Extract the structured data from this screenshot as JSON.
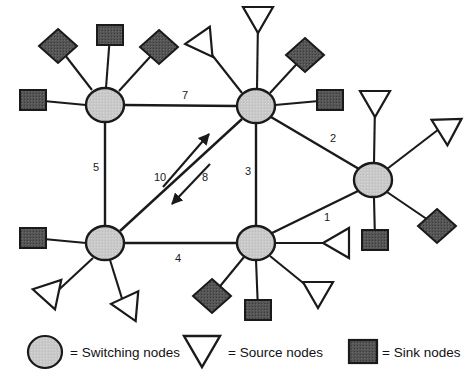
{
  "figure": {
    "type": "network-diagram",
    "background": "#ffffff",
    "stroke_color": "#1a1a1a",
    "switching_fill": "#c8c8c8",
    "sink_fill": "#4d4d4d",
    "source_fill": "#ffffff"
  },
  "switching_nodes": [
    {
      "id": "sw-top-left",
      "x": 105,
      "y": 105,
      "rx": 19,
      "ry": 17
    },
    {
      "id": "sw-top-center",
      "x": 256,
      "y": 106,
      "rx": 19,
      "ry": 17
    },
    {
      "id": "sw-right",
      "x": 373,
      "y": 180,
      "rx": 19,
      "ry": 17
    },
    {
      "id": "sw-bottom-left",
      "x": 105,
      "y": 243,
      "rx": 19,
      "ry": 17
    },
    {
      "id": "sw-bottom-center",
      "x": 256,
      "y": 243,
      "rx": 19,
      "ry": 17
    }
  ],
  "trunk_edges": [
    {
      "id": "edge-7",
      "label": "7",
      "from": "sw-top-left",
      "to": "sw-top-center",
      "x1": 124,
      "y1": 105,
      "x2": 237,
      "y2": 106,
      "lx": 185,
      "ly": 96
    },
    {
      "id": "edge-5",
      "label": "5",
      "from": "sw-top-left",
      "to": "sw-bottom-left",
      "x1": 105,
      "y1": 122,
      "x2": 105,
      "y2": 226,
      "lx": 96,
      "ly": 168
    },
    {
      "id": "edge-2",
      "label": "2",
      "from": "sw-top-center",
      "to": "sw-right",
      "x1": 271,
      "y1": 117,
      "x2": 359,
      "y2": 169,
      "lx": 333,
      "ly": 139
    },
    {
      "id": "edge-3",
      "label": "3",
      "from": "sw-top-center",
      "to": "sw-bottom-center",
      "x1": 256,
      "y1": 123,
      "x2": 256,
      "y2": 226,
      "lx": 248,
      "ly": 172
    },
    {
      "id": "edge-1",
      "label": "1",
      "from": "sw-bottom-center",
      "to": "sw-right",
      "x1": 272,
      "y1": 233,
      "x2": 358,
      "y2": 191,
      "lx": 327,
      "ly": 218
    },
    {
      "id": "edge-4",
      "label": "4",
      "from": "sw-bottom-left",
      "to": "sw-bottom-center",
      "x1": 124,
      "y1": 243,
      "x2": 237,
      "y2": 243,
      "lx": 178,
      "ly": 259
    },
    {
      "id": "edge-diagonal",
      "label": "",
      "from": "sw-bottom-left",
      "to": "sw-top-center",
      "x1": 120,
      "y1": 231,
      "x2": 242,
      "y2": 119,
      "lx": 0,
      "ly": 0
    }
  ],
  "flow_arrows": [
    {
      "id": "arrow-10",
      "label": "10",
      "x1": 163,
      "y1": 187,
      "x2": 209,
      "y2": 134,
      "lx": 160,
      "ly": 178
    },
    {
      "id": "arrow-8",
      "label": "8",
      "x1": 210,
      "y1": 164,
      "x2": 172,
      "y2": 204,
      "lx": 205,
      "ly": 178
    }
  ],
  "leaf_nodes": [
    {
      "id": "leaf-tl-diamond-nw",
      "kind": "sink",
      "shape": "diamond",
      "x": 58,
      "y": 46,
      "parent": "sw-top-left",
      "ax": 92,
      "ay": 90
    },
    {
      "id": "leaf-tl-square-n",
      "kind": "sink",
      "shape": "square",
      "x": 110,
      "y": 35,
      "parent": "sw-top-left",
      "ax": 106,
      "ay": 88
    },
    {
      "id": "leaf-tl-diamond-ne",
      "kind": "sink",
      "shape": "diamond",
      "x": 159,
      "y": 47,
      "parent": "sw-top-left",
      "ax": 119,
      "ay": 91
    },
    {
      "id": "leaf-tl-square-w",
      "kind": "sink",
      "shape": "square",
      "x": 33,
      "y": 100,
      "parent": "sw-top-left",
      "ax": 86,
      "ay": 105
    },
    {
      "id": "leaf-tc-triangle-n",
      "kind": "source",
      "shape": "triangle",
      "x": 258,
      "y": 20,
      "parent": "sw-top-center",
      "ax": 257,
      "ay": 89
    },
    {
      "id": "leaf-tc-triangle-nw",
      "kind": "source",
      "shape": "triangle",
      "x": 205,
      "y": 46,
      "parent": "sw-top-center",
      "ax": 242,
      "ay": 93
    },
    {
      "id": "leaf-tc-diamond-ne",
      "kind": "sink",
      "shape": "diamond",
      "x": 305,
      "y": 55,
      "parent": "sw-top-center",
      "ax": 270,
      "ay": 93
    },
    {
      "id": "leaf-tc-square-e",
      "kind": "sink",
      "shape": "square",
      "x": 330,
      "y": 100,
      "parent": "sw-top-center",
      "ax": 275,
      "ay": 105
    },
    {
      "id": "leaf-r-triangle-n",
      "kind": "source",
      "shape": "triangle",
      "x": 375,
      "y": 104,
      "parent": "sw-right",
      "ax": 374,
      "ay": 163
    },
    {
      "id": "leaf-r-triangle-ne",
      "kind": "source",
      "shape": "triangle",
      "x": 443,
      "y": 126,
      "parent": "sw-right",
      "ax": 387,
      "ay": 169
    },
    {
      "id": "leaf-r-diamond-se",
      "kind": "sink",
      "shape": "diamond",
      "x": 437,
      "y": 226,
      "parent": "sw-right",
      "ax": 387,
      "ay": 192
    },
    {
      "id": "leaf-r-square-s",
      "kind": "sink",
      "shape": "square",
      "x": 375,
      "y": 240,
      "parent": "sw-right",
      "ax": 374,
      "ay": 198
    },
    {
      "id": "leaf-bl-square-w",
      "kind": "sink",
      "shape": "square",
      "x": 33,
      "y": 238,
      "parent": "sw-bottom-left",
      "ax": 86,
      "ay": 243
    },
    {
      "id": "leaf-bl-triangle-sw",
      "kind": "source",
      "shape": "triangle",
      "x": 51,
      "y": 297,
      "parent": "sw-bottom-left",
      "ax": 93,
      "ay": 258
    },
    {
      "id": "leaf-bl-triangle-s",
      "kind": "source",
      "shape": "triangle",
      "x": 124,
      "y": 305,
      "parent": "sw-bottom-left",
      "ax": 110,
      "ay": 260
    },
    {
      "id": "leaf-bc-triangle-e",
      "kind": "source",
      "shape": "triangle",
      "x": 336,
      "y": 243,
      "parent": "sw-bottom-center",
      "ax": 275,
      "ay": 243
    },
    {
      "id": "leaf-bc-diamond-sw",
      "kind": "sink",
      "shape": "diamond",
      "x": 212,
      "y": 296,
      "parent": "sw-bottom-center",
      "ax": 244,
      "ay": 257
    },
    {
      "id": "leaf-bc-square-s",
      "kind": "sink",
      "shape": "square",
      "x": 258,
      "y": 310,
      "parent": "sw-bottom-center",
      "ax": 256,
      "ay": 260
    },
    {
      "id": "leaf-bc-triangle-se",
      "kind": "source",
      "shape": "triangle",
      "x": 318,
      "y": 295,
      "parent": "sw-bottom-center",
      "ax": 270,
      "ay": 256
    }
  ],
  "legend": {
    "items": [
      {
        "id": "legend-switching",
        "shape": "circle",
        "label": "= Switching nodes",
        "sx": 45,
        "sy": 352,
        "tx": 70,
        "ty": 353
      },
      {
        "id": "legend-source",
        "shape": "triangle",
        "label": "= Source nodes",
        "sx": 202,
        "sy": 351,
        "tx": 228,
        "ty": 353
      },
      {
        "id": "legend-sink",
        "shape": "square",
        "label": "= Sink nodes",
        "sx": 363,
        "sy": 352,
        "tx": 382,
        "ty": 353
      }
    ]
  }
}
